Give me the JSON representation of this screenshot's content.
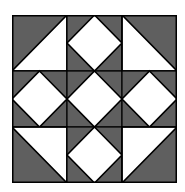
{
  "diagram": {
    "type": "quilt-block",
    "grid": {
      "rows": 3,
      "cols": 3
    },
    "colors": {
      "dark": "#5f5f5f",
      "light": "#ffffff",
      "line": "#000000"
    },
    "cells": [
      {
        "row": 0,
        "col": 0,
        "pattern": "triangle-light-bottom-right"
      },
      {
        "row": 0,
        "col": 1,
        "pattern": "diamond"
      },
      {
        "row": 0,
        "col": 2,
        "pattern": "triangle-light-bottom-left"
      },
      {
        "row": 1,
        "col": 0,
        "pattern": "diamond"
      },
      {
        "row": 1,
        "col": 1,
        "pattern": "diamond"
      },
      {
        "row": 1,
        "col": 2,
        "pattern": "diamond"
      },
      {
        "row": 2,
        "col": 0,
        "pattern": "triangle-light-top-right"
      },
      {
        "row": 2,
        "col": 1,
        "pattern": "diamond"
      },
      {
        "row": 2,
        "col": 2,
        "pattern": "triangle-light-top-left"
      }
    ]
  }
}
